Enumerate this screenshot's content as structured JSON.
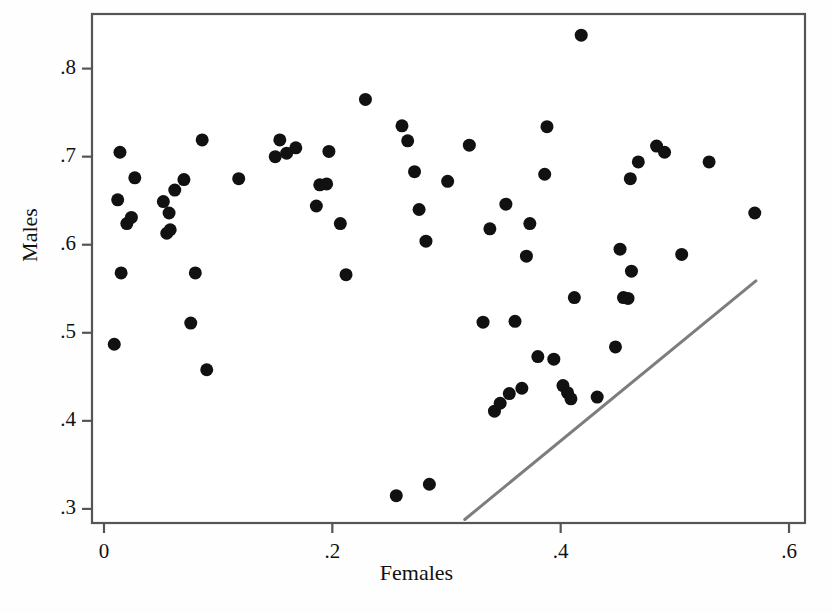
{
  "chart_data": {
    "type": "scatter",
    "title": "",
    "xlabel": "Females",
    "ylabel": "Males",
    "xlim": [
      -0.0105,
      0.614
    ],
    "ylim": [
      0.284,
      0.862
    ],
    "xticks": [
      0,
      0.2,
      0.4,
      0.6
    ],
    "xticklabels": [
      "0",
      ".2",
      ".4",
      ".6"
    ],
    "yticks": [
      0.3,
      0.4,
      0.5,
      0.6,
      0.7,
      0.8
    ],
    "yticklabels": [
      ".3",
      ".4",
      ".5",
      ".6",
      ".7",
      ".8"
    ],
    "grid": false,
    "legend": null,
    "marker": {
      "shape": "circle",
      "color": "#111111",
      "size": 13
    },
    "frame_color": "#555555",
    "background": "#ffffff",
    "points": [
      {
        "x": 0.009,
        "y": 0.487
      },
      {
        "x": 0.012,
        "y": 0.651
      },
      {
        "x": 0.014,
        "y": 0.705
      },
      {
        "x": 0.015,
        "y": 0.568
      },
      {
        "x": 0.02,
        "y": 0.624
      },
      {
        "x": 0.024,
        "y": 0.631
      },
      {
        "x": 0.027,
        "y": 0.676
      },
      {
        "x": 0.052,
        "y": 0.649
      },
      {
        "x": 0.055,
        "y": 0.613
      },
      {
        "x": 0.057,
        "y": 0.636
      },
      {
        "x": 0.058,
        "y": 0.617
      },
      {
        "x": 0.062,
        "y": 0.662
      },
      {
        "x": 0.07,
        "y": 0.674
      },
      {
        "x": 0.076,
        "y": 0.511
      },
      {
        "x": 0.08,
        "y": 0.568
      },
      {
        "x": 0.086,
        "y": 0.719
      },
      {
        "x": 0.09,
        "y": 0.458
      },
      {
        "x": 0.118,
        "y": 0.675
      },
      {
        "x": 0.15,
        "y": 0.7
      },
      {
        "x": 0.154,
        "y": 0.719
      },
      {
        "x": 0.16,
        "y": 0.704
      },
      {
        "x": 0.168,
        "y": 0.71
      },
      {
        "x": 0.186,
        "y": 0.644
      },
      {
        "x": 0.189,
        "y": 0.668
      },
      {
        "x": 0.195,
        "y": 0.669
      },
      {
        "x": 0.197,
        "y": 0.706
      },
      {
        "x": 0.207,
        "y": 0.624
      },
      {
        "x": 0.212,
        "y": 0.566
      },
      {
        "x": 0.229,
        "y": 0.765
      },
      {
        "x": 0.256,
        "y": 0.315
      },
      {
        "x": 0.261,
        "y": 0.735
      },
      {
        "x": 0.266,
        "y": 0.718
      },
      {
        "x": 0.272,
        "y": 0.683
      },
      {
        "x": 0.276,
        "y": 0.64
      },
      {
        "x": 0.282,
        "y": 0.604
      },
      {
        "x": 0.285,
        "y": 0.328
      },
      {
        "x": 0.301,
        "y": 0.672
      },
      {
        "x": 0.32,
        "y": 0.713
      },
      {
        "x": 0.332,
        "y": 0.512
      },
      {
        "x": 0.338,
        "y": 0.618
      },
      {
        "x": 0.342,
        "y": 0.411
      },
      {
        "x": 0.347,
        "y": 0.42
      },
      {
        "x": 0.352,
        "y": 0.646
      },
      {
        "x": 0.355,
        "y": 0.431
      },
      {
        "x": 0.36,
        "y": 0.513
      },
      {
        "x": 0.366,
        "y": 0.437
      },
      {
        "x": 0.37,
        "y": 0.587
      },
      {
        "x": 0.373,
        "y": 0.624
      },
      {
        "x": 0.38,
        "y": 0.473
      },
      {
        "x": 0.386,
        "y": 0.68
      },
      {
        "x": 0.388,
        "y": 0.734
      },
      {
        "x": 0.394,
        "y": 0.47
      },
      {
        "x": 0.402,
        "y": 0.44
      },
      {
        "x": 0.406,
        "y": 0.432
      },
      {
        "x": 0.409,
        "y": 0.425
      },
      {
        "x": 0.412,
        "y": 0.54
      },
      {
        "x": 0.418,
        "y": 0.838
      },
      {
        "x": 0.432,
        "y": 0.427
      },
      {
        "x": 0.448,
        "y": 0.484
      },
      {
        "x": 0.452,
        "y": 0.595
      },
      {
        "x": 0.455,
        "y": 0.54
      },
      {
        "x": 0.459,
        "y": 0.539
      },
      {
        "x": 0.461,
        "y": 0.675
      },
      {
        "x": 0.462,
        "y": 0.57
      },
      {
        "x": 0.468,
        "y": 0.694
      },
      {
        "x": 0.484,
        "y": 0.712
      },
      {
        "x": 0.491,
        "y": 0.705
      },
      {
        "x": 0.506,
        "y": 0.589
      },
      {
        "x": 0.53,
        "y": 0.694
      },
      {
        "x": 0.57,
        "y": 0.636
      }
    ],
    "reference_line": {
      "type": "line",
      "color": "#7d7d7d",
      "width": 3,
      "x0": 0.316,
      "y0": 0.288,
      "x1": 0.571,
      "y1": 0.559
    }
  },
  "axes": {
    "x_tick_px": [
      104,
      294,
      529,
      788
    ],
    "y_tick_px": [
      487,
      404,
      322,
      240,
      157,
      74
    ]
  }
}
